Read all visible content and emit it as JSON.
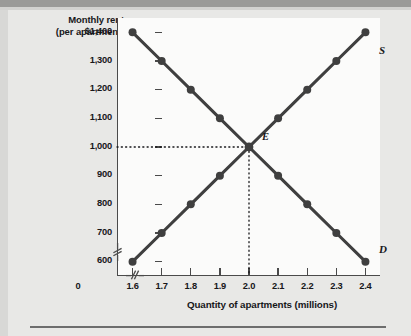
{
  "chart_data": {
    "type": "line",
    "title": "",
    "xlabel": "Quantity of apartments (millions)",
    "ylabel_line1": "Monthly rent",
    "ylabel_line2": "(per apartment)",
    "x": [
      1.6,
      1.7,
      1.8,
      1.9,
      2.0,
      2.1,
      2.2,
      2.3,
      2.4
    ],
    "xlim": [
      1.55,
      2.45
    ],
    "ylim": [
      550,
      1450
    ],
    "xtick_labels": [
      "1.6",
      "1.7",
      "1.8",
      "1.9",
      "2.0",
      "2.1",
      "2.2",
      "2.3",
      "2.4"
    ],
    "ytick_labels": [
      "$1,400",
      "1,300",
      "1,200",
      "1,100",
      "1,000",
      "900",
      "800",
      "700",
      "600"
    ],
    "ytick_values": [
      1400,
      1300,
      1200,
      1100,
      1000,
      900,
      800,
      700,
      600
    ],
    "origin_label": "0",
    "grid": false,
    "legend_position": "curve-end-labels",
    "series": [
      {
        "name": "D",
        "label": "D",
        "description": "Demand curve",
        "color": "#3f3f3f",
        "values": [
          1400,
          1300,
          1200,
          1100,
          1000,
          900,
          800,
          700,
          600
        ]
      },
      {
        "name": "S",
        "label": "S",
        "description": "Supply curve",
        "color": "#3f3f3f",
        "values": [
          600,
          700,
          800,
          900,
          1000,
          1100,
          1200,
          1300,
          1400
        ]
      }
    ],
    "annotations": [
      {
        "name": "equilibrium",
        "label": "E",
        "x": 2.0,
        "y": 1000,
        "guide_lines": "dotted horizontal to y-axis and dotted vertical to x-axis"
      }
    ],
    "axis_breaks": {
      "y_axis": true,
      "x_axis": true,
      "marker": "//"
    }
  },
  "colors": {
    "page_background": "#e8e8e6",
    "plot_background": "#fbfbfa",
    "axis": "#4a4a4a",
    "curve": "#3f3f3f",
    "text": "#17171a",
    "rule": "#6d6d6d"
  }
}
